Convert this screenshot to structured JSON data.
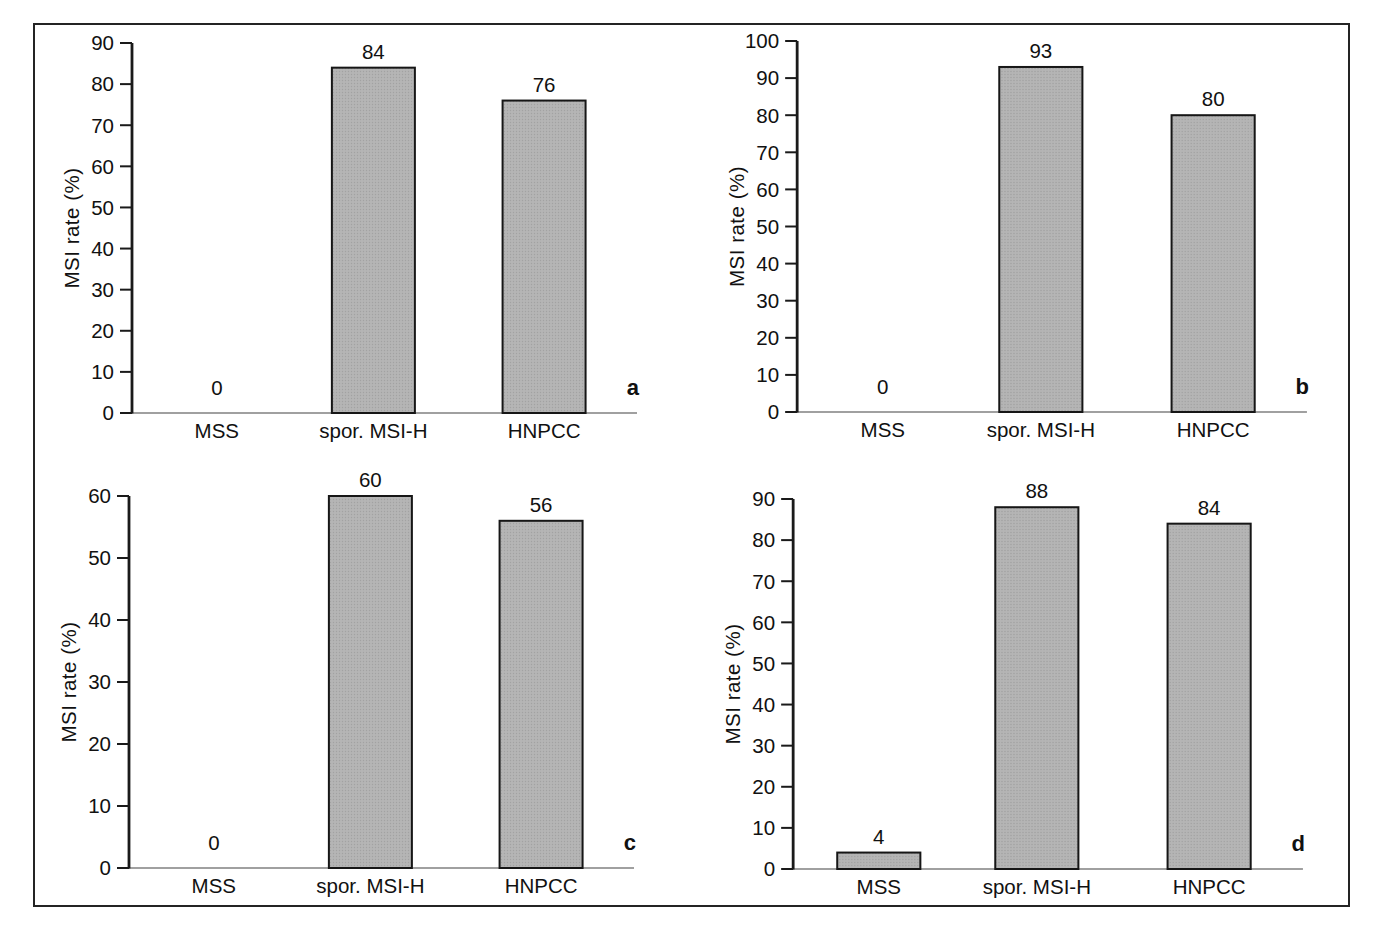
{
  "figure": {
    "panel_letters": [
      "a",
      "b",
      "c",
      "d"
    ],
    "shared_ylabel": "MSI rate (%)",
    "shared_categories": [
      "MSS",
      "spor. MSI-H",
      "HNPCC"
    ]
  },
  "style": {
    "background": "#ffffff",
    "frame_color": "#242424",
    "axis_color": "#1a1a1a",
    "baseline_color": "#808080",
    "text_color": "#111111",
    "bar_fill": "#b5b5b5",
    "bar_dot": "#a2a2a2",
    "bar_stroke": "#161616"
  },
  "chart_data": [
    {
      "type": "bar",
      "panel_label": "a",
      "title": "",
      "categories": [
        "MSS",
        "spor. MSI-H",
        "HNPCC"
      ],
      "values": [
        0,
        84,
        76
      ],
      "value_labels": [
        "0",
        "84",
        "76"
      ],
      "xlabel": "",
      "ylabel": "MSI rate (%)",
      "ylim": [
        0,
        90
      ],
      "ytick_step": 10,
      "ytick_labels": [
        "0",
        "10",
        "20",
        "30",
        "40",
        "50",
        "60",
        "70",
        "80",
        "90"
      ],
      "grid": false,
      "legend": false
    },
    {
      "type": "bar",
      "panel_label": "b",
      "title": "",
      "categories": [
        "MSS",
        "spor. MSI-H",
        "HNPCC"
      ],
      "values": [
        0,
        93,
        80
      ],
      "value_labels": [
        "0",
        "93",
        "80"
      ],
      "xlabel": "",
      "ylabel": "MSI rate (%)",
      "ylim": [
        0,
        100
      ],
      "ytick_step": 10,
      "ytick_labels": [
        "0",
        "10",
        "20",
        "30",
        "40",
        "50",
        "60",
        "70",
        "80",
        "90",
        "100"
      ],
      "grid": false,
      "legend": false
    },
    {
      "type": "bar",
      "panel_label": "c",
      "title": "",
      "categories": [
        "MSS",
        "spor. MSI-H",
        "HNPCC"
      ],
      "values": [
        0,
        60,
        56
      ],
      "value_labels": [
        "0",
        "60",
        "56"
      ],
      "xlabel": "",
      "ylabel": "MSI rate (%)",
      "ylim": [
        0,
        60
      ],
      "ytick_step": 10,
      "ytick_labels": [
        "0",
        "10",
        "20",
        "30",
        "40",
        "50",
        "60"
      ],
      "grid": false,
      "legend": false
    },
    {
      "type": "bar",
      "panel_label": "d",
      "title": "",
      "categories": [
        "MSS",
        "spor. MSI-H",
        "HNPCC"
      ],
      "values": [
        4,
        88,
        84
      ],
      "value_labels": [
        "4",
        "88",
        "84"
      ],
      "xlabel": "",
      "ylabel": "MSI rate (%)",
      "ylim": [
        0,
        90
      ],
      "ytick_step": 10,
      "ytick_labels": [
        "0",
        "10",
        "20",
        "30",
        "40",
        "50",
        "60",
        "70",
        "80",
        "90"
      ],
      "grid": false,
      "legend": false
    }
  ]
}
